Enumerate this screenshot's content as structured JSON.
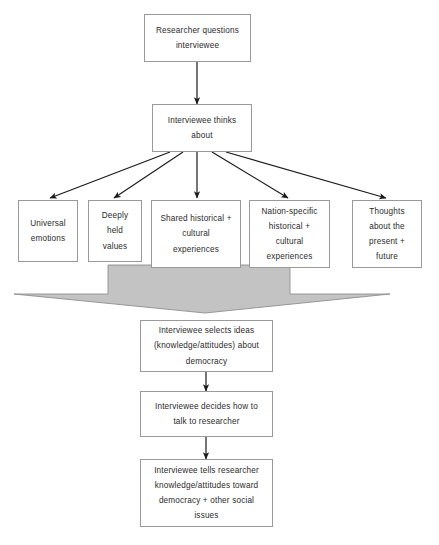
{
  "diagram": {
    "title_visible": false,
    "colors": {
      "box_border": "#9a9a9a",
      "box_fill": "#ffffff",
      "text": "#2b2b2b",
      "arrow_stroke": "#1a1a1a",
      "block_arrow_fill": "#c3c3c3",
      "block_arrow_stroke": "#8f8f8f"
    },
    "nodes": {
      "researcher_questions": {
        "lines": [
          "Researcher questions",
          "interviewee"
        ]
      },
      "interviewee_thinks": {
        "lines": [
          "Interviewee thinks",
          "about"
        ]
      },
      "universal_emotions": {
        "lines": [
          "Universal",
          "emotions"
        ]
      },
      "deeply_held_values": {
        "lines": [
          "Deeply",
          "held",
          "values"
        ]
      },
      "shared_historical": {
        "lines": [
          "Shared historical +",
          "cultural",
          "experiences"
        ]
      },
      "nation_specific": {
        "lines": [
          "Nation-specific",
          "historical +",
          "cultural",
          "experiences"
        ]
      },
      "thoughts_present_future": {
        "lines": [
          "Thoughts",
          "about the",
          "present +",
          "future"
        ]
      },
      "selects_ideas": {
        "lines": [
          "Interviewee selects ideas",
          "(knowledge/attitudes) about",
          "democracy"
        ]
      },
      "decides_how": {
        "lines": [
          "Interviewee decides how to",
          "talk to researcher"
        ]
      },
      "tells_researcher": {
        "lines": [
          "Interviewee tells researcher",
          "knowledge/attitudes toward",
          "democracy + other social",
          "issues"
        ]
      }
    }
  }
}
